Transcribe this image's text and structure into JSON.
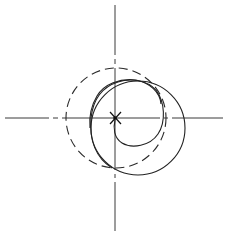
{
  "diagram": {
    "colors": {
      "background": "#ffffff",
      "line": "#222222"
    },
    "elements": {
      "axes": [
        "horizontal-axis",
        "vertical-axis"
      ],
      "center_marker": "x-mark",
      "reference_circle": "dashed",
      "trajectory": "solid spiral"
    }
  }
}
